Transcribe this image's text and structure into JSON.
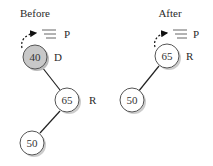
{
  "before": {
    "title": "Before",
    "pointer_label": "P",
    "nodes": [
      {
        "value": "40",
        "tag": "D",
        "highlighted": true
      },
      {
        "value": "65",
        "tag": "R",
        "highlighted": false
      },
      {
        "value": "50",
        "tag": "",
        "highlighted": false
      }
    ]
  },
  "after": {
    "title": "After",
    "pointer_label": "P",
    "nodes": [
      {
        "value": "65",
        "tag": "R",
        "highlighted": false
      },
      {
        "value": "50",
        "tag": "",
        "highlighted": false
      }
    ]
  },
  "colors": {
    "deleted_node_fill": "#c8c8c8",
    "node_fill": "#ffffff",
    "edge": "#222222",
    "shadow": "#bbbbbb"
  }
}
